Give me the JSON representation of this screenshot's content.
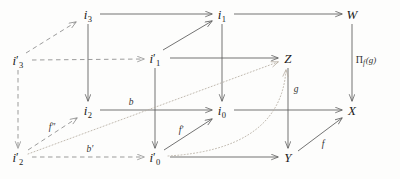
{
  "figure": {
    "kind": "commutative-diagram",
    "background_color": "#fdfdfc",
    "solid_stroke": "#5a5a5a",
    "dashed_stroke": "#8a8a8a",
    "dotted_stroke": "#b5aca0",
    "text_color": "#1b1b1b"
  },
  "nodes": [
    {
      "id": "i3",
      "base": "i",
      "sub": "3",
      "prime": "",
      "x": 88,
      "y": 14
    },
    {
      "id": "i1",
      "base": "i",
      "sub": "1",
      "prime": "",
      "x": 222,
      "y": 14
    },
    {
      "id": "W",
      "base": "W",
      "sub": "",
      "prime": "",
      "x": 352,
      "y": 14
    },
    {
      "id": "i3prime",
      "base": "i",
      "sub": "3",
      "prime": "′",
      "x": 18,
      "y": 60
    },
    {
      "id": "i1prime",
      "base": "i",
      "sub": "1",
      "prime": "′",
      "x": 155,
      "y": 58
    },
    {
      "id": "Z",
      "base": "Z",
      "sub": "",
      "prime": "",
      "x": 288,
      "y": 58
    },
    {
      "id": "i2",
      "base": "i",
      "sub": "2",
      "prime": "",
      "x": 88,
      "y": 110
    },
    {
      "id": "i0",
      "base": "i",
      "sub": "0",
      "prime": "",
      "x": 222,
      "y": 110
    },
    {
      "id": "X",
      "base": "X",
      "sub": "",
      "prime": "",
      "x": 352,
      "y": 110
    },
    {
      "id": "i2prime",
      "base": "i",
      "sub": "2",
      "prime": "′",
      "x": 18,
      "y": 157
    },
    {
      "id": "i0prime",
      "base": "i",
      "sub": "0",
      "prime": "′",
      "x": 155,
      "y": 157
    },
    {
      "id": "Y",
      "base": "Y",
      "sub": "",
      "prime": "",
      "x": 288,
      "y": 157
    }
  ],
  "edge_labels": [
    {
      "id": "b",
      "text": "b",
      "x": 131,
      "y": 103
    },
    {
      "id": "bprime",
      "text": "b′",
      "x": 90,
      "y": 150
    },
    {
      "id": "fprime",
      "text": "f′",
      "x": 181,
      "y": 131
    },
    {
      "id": "f2prime",
      "text": "f″",
      "x": 52,
      "y": 128
    },
    {
      "id": "g",
      "text": "g",
      "x": 296,
      "y": 90
    },
    {
      "id": "f",
      "text": "f",
      "x": 323,
      "y": 145
    }
  ],
  "pi_label": {
    "symbol": "Π",
    "subscript": "f",
    "argument": "(g)",
    "x": 366,
    "y": 60
  }
}
